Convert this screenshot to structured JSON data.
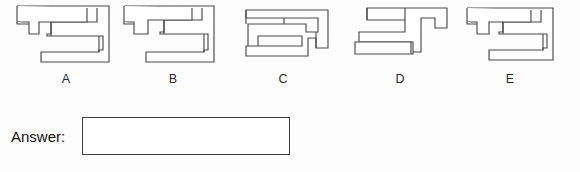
{
  "page": {
    "background_color": "#fdfdfd",
    "stroke_color": "#4a4a4a",
    "fill_color": "#ffffff"
  },
  "question": {
    "options": [
      {
        "label": "A",
        "figure_name": "zigzag-maze-shape-a",
        "path": "M 8 4 L 96 4 L 96 58 L 32 58 L 32 48 L 86 48 L 86 38 L 28 38 L 28 28 L 76 28 L 76 18 L 22 18 L 22 30 L 14 30 L 14 12 L 8 12 Z"
      },
      {
        "label": "B",
        "figure_name": "zigzag-maze-shape-b",
        "path": "M 6 4 L 94 4 L 94 58 L 28 58 L 28 48 L 84 48 L 84 34 L 40 34 L 40 24 L 80 24 L 80 14 L 18 14 L 18 24 L 10 24 L 10 12 L 6 12 Z"
      },
      {
        "label": "C",
        "figure_name": "zigzag-maze-shape-c",
        "path": "M 6 8 L 92 8 L 92 50 L 80 50 L 80 40 L 72 40 L 72 54 L 10 54 L 10 44 L 66 44 L 66 34 L 24 34 L 24 44 L 14 44 L 14 22 L 72 22 L 72 30 L 82 30 L 82 16 L 6 16 Z"
      },
      {
        "label": "D",
        "figure_name": "zigzag-maze-shape-d",
        "path": "M 14 4 L 96 4 L 96 22 L 84 22 L 84 12 L 70 12 L 70 44 L 62 44 L 62 34 L 8 34 L 8 24 L 56 24 L 56 14 L 14 14 Z M 6 44 L 62 44 L 62 54 L 6 54 Z"
      },
      {
        "label": "E",
        "figure_name": "zigzag-maze-shape-e",
        "path": "M 8 4 L 94 4 L 94 58 L 30 58 L 30 48 L 84 48 L 84 36 L 38 36 L 38 26 L 78 26 L 78 16 L 20 16 L 20 26 L 12 26 L 12 12 L 8 12 Z"
      }
    ]
  },
  "answer": {
    "label": "Answer:",
    "value": "",
    "placeholder": ""
  }
}
